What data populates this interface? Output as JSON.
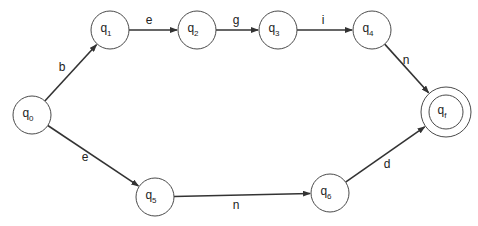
{
  "diagram": {
    "type": "finite-automaton",
    "states": [
      {
        "id": "q0",
        "base": "q",
        "sub": "0",
        "x": 32,
        "y": 115,
        "r": 19,
        "accepting": false
      },
      {
        "id": "q1",
        "base": "q",
        "sub": "1",
        "x": 110,
        "y": 30,
        "r": 19,
        "accepting": false
      },
      {
        "id": "q2",
        "base": "q",
        "sub": "2",
        "x": 197,
        "y": 30,
        "r": 19,
        "accepting": false
      },
      {
        "id": "q3",
        "base": "q",
        "sub": "3",
        "x": 278,
        "y": 30,
        "r": 19,
        "accepting": false
      },
      {
        "id": "q4",
        "base": "q",
        "sub": "4",
        "x": 372,
        "y": 30,
        "r": 19,
        "accepting": false
      },
      {
        "id": "qf",
        "base": "q",
        "sub": "f",
        "x": 446,
        "y": 112,
        "r": 25,
        "accepting": true
      },
      {
        "id": "q5",
        "base": "q",
        "sub": "5",
        "x": 155,
        "y": 197,
        "r": 19,
        "accepting": false
      },
      {
        "id": "q6",
        "base": "q",
        "sub": "6",
        "x": 330,
        "y": 193,
        "r": 19,
        "accepting": false
      }
    ],
    "transitions": [
      {
        "from": "q0",
        "to": "q1",
        "label": "b",
        "lx": 62,
        "ly": 71
      },
      {
        "from": "q1",
        "to": "q2",
        "label": "e",
        "lx": 149,
        "ly": 24
      },
      {
        "from": "q2",
        "to": "q3",
        "label": "g",
        "lx": 236,
        "ly": 24
      },
      {
        "from": "q3",
        "to": "q4",
        "label": "i",
        "lx": 323,
        "ly": 24
      },
      {
        "from": "q4",
        "to": "qf",
        "label": "n",
        "lx": 406,
        "ly": 64
      },
      {
        "from": "q0",
        "to": "q5",
        "label": "e",
        "lx": 85,
        "ly": 161
      },
      {
        "from": "q5",
        "to": "q6",
        "label": "n",
        "lx": 236,
        "ly": 209
      },
      {
        "from": "q6",
        "to": "qf",
        "label": "d",
        "lx": 387,
        "ly": 168
      }
    ]
  }
}
